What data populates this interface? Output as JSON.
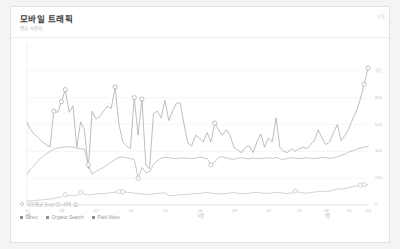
{
  "card": {
    "title": "모바일 트래픽",
    "subtitle": "평균 사용자",
    "y_axis_unit": "단위"
  },
  "options": {
    "radio_label": "이동평균 표시(7일 / 선택 값)"
  },
  "chart_data": {
    "type": "line",
    "title": "모바일 트래픽",
    "subtitle": "평균 사용자",
    "xlabel": "",
    "ylabel": "단위",
    "ylim": [
      0,
      1200
    ],
    "yticks": [
      0,
      200,
      400,
      600,
      800,
      1000
    ],
    "ytick_labels": [
      "0",
      "200",
      "400",
      "600",
      "800",
      "1천"
    ],
    "grid": true,
    "legend_position": "bottom-left",
    "x": [
      "01",
      "02",
      "03",
      "04",
      "05",
      "06",
      "07",
      "08",
      "09",
      "10",
      "11",
      "12",
      "13",
      "14",
      "15",
      "16",
      "17",
      "18",
      "19",
      "20",
      "21",
      "22",
      "23",
      "24",
      "25",
      "26",
      "27",
      "28",
      "29",
      "30",
      "31",
      "32",
      "33",
      "34",
      "35",
      "36",
      "37",
      "38",
      "39",
      "40",
      "41",
      "42",
      "43",
      "44",
      "45",
      "46",
      "47",
      "48",
      "49",
      "50",
      "51",
      "52",
      "53",
      "54",
      "55",
      "56",
      "57",
      "58",
      "59",
      "60",
      "61",
      "62",
      "63",
      "64",
      "65",
      "66",
      "67",
      "68",
      "69",
      "70",
      "71",
      "72",
      "73",
      "74",
      "75",
      "76",
      "77",
      "78",
      "79",
      "80",
      "81",
      "82",
      "83",
      "84",
      "85",
      "86",
      "87",
      "88",
      "89",
      "90"
    ],
    "xticks": [
      {
        "index": 0,
        "label": "01",
        "month": "1월"
      },
      {
        "index": 9,
        "label": "04",
        "month": ""
      },
      {
        "index": 18,
        "label": "07",
        "month": ""
      },
      {
        "index": 27,
        "label": "10",
        "month": ""
      },
      {
        "index": 36,
        "label": "13",
        "month": ""
      },
      {
        "index": 45,
        "label": "16",
        "month": "6월"
      },
      {
        "index": 54,
        "label": "19",
        "month": ""
      },
      {
        "index": 63,
        "label": "22",
        "month": ""
      },
      {
        "index": 71,
        "label": "25",
        "month": ""
      },
      {
        "index": 78,
        "label": "28",
        "month": "7월"
      },
      {
        "index": 84,
        "label": "31",
        "month": ""
      },
      {
        "index": 89,
        "label": "03",
        "month": ""
      }
    ],
    "series": [
      {
        "name": "Direct",
        "color": "#a8a8a8",
        "values": [
          615,
          560,
          525,
          500,
          470,
          448,
          432,
          700,
          690,
          770,
          860,
          690,
          740,
          430,
          620,
          560,
          270,
          700,
          640,
          660,
          700,
          735,
          720,
          880,
          600,
          470,
          440,
          420,
          800,
          520,
          790,
          300,
          270,
          680,
          700,
          650,
          780,
          630,
          700,
          760,
          760,
          600,
          460,
          440,
          520,
          500,
          470,
          540,
          470,
          610,
          560,
          520,
          560,
          520,
          430,
          410,
          390,
          430,
          440,
          390,
          470,
          530,
          430,
          500,
          470,
          650,
          430,
          400,
          390,
          420,
          400,
          420,
          430,
          420,
          450,
          480,
          560,
          500,
          450,
          470,
          540,
          600,
          480,
          520,
          570,
          640,
          700,
          790,
          900,
          1020
        ],
        "markers": [
          {
            "index": 7,
            "value": 700
          },
          {
            "index": 9,
            "value": 770
          },
          {
            "index": 10,
            "value": 860
          },
          {
            "index": 23,
            "value": 880
          },
          {
            "index": 28,
            "value": 800
          },
          {
            "index": 30,
            "value": 790
          },
          {
            "index": 49,
            "value": 610
          },
          {
            "index": 88,
            "value": 900
          },
          {
            "index": 89,
            "value": 1020
          }
        ]
      },
      {
        "name": "Organic Search",
        "color": "#b5b5b5",
        "values": [
          230,
          270,
          300,
          330,
          360,
          380,
          400,
          415,
          425,
          430,
          432,
          434,
          430,
          425,
          420,
          415,
          300,
          230,
          250,
          265,
          280,
          300,
          320,
          340,
          355,
          358,
          352,
          345,
          340,
          200,
          280,
          240,
          250,
          300,
          330,
          348,
          355,
          352,
          348,
          345,
          350,
          352,
          348,
          345,
          350,
          355,
          352,
          348,
          300,
          320,
          355,
          360,
          350,
          345,
          340,
          348,
          352,
          348,
          345,
          350,
          348,
          345,
          350,
          352,
          348,
          355,
          345,
          340,
          348,
          352,
          348,
          345,
          348,
          352,
          348,
          345,
          350,
          355,
          352,
          348,
          352,
          360,
          370,
          380,
          395,
          405,
          415,
          425,
          432,
          438
        ],
        "markers": [
          {
            "index": 16,
            "value": 300
          },
          {
            "index": 29,
            "value": 200
          },
          {
            "index": 48,
            "value": 300
          }
        ]
      },
      {
        "name": "Paid Video",
        "color": "#c4c4c4",
        "values": [
          30,
          32,
          34,
          36,
          38,
          42,
          45,
          50,
          55,
          60,
          78,
          70,
          68,
          72,
          95,
          80,
          74,
          78,
          82,
          85,
          84,
          88,
          92,
          96,
          100,
          98,
          95,
          92,
          88,
          85,
          82,
          80,
          78,
          82,
          86,
          88,
          92,
          70,
          72,
          74,
          76,
          78,
          80,
          82,
          84,
          86,
          90,
          94,
          88,
          86,
          84,
          82,
          86,
          90,
          92,
          88,
          86,
          84,
          88,
          92,
          96,
          90,
          88,
          86,
          90,
          94,
          92,
          88,
          86,
          90,
          104,
          96,
          90,
          88,
          92,
          96,
          100,
          104,
          98,
          104,
          112,
          120,
          118,
          124,
          130,
          136,
          142,
          148,
          152,
          150
        ],
        "markers": [
          {
            "index": 10,
            "value": 78
          },
          {
            "index": 14,
            "value": 95
          },
          {
            "index": 24,
            "value": 100
          },
          {
            "index": 25,
            "value": 98
          },
          {
            "index": 70,
            "value": 104
          },
          {
            "index": 87,
            "value": 148
          },
          {
            "index": 88,
            "value": 152
          }
        ]
      }
    ]
  },
  "legend": [
    {
      "label": "Direct",
      "color": "#8f8f8f"
    },
    {
      "label": "Organic Search",
      "color": "#8f8f8f"
    },
    {
      "label": "Paid Video",
      "color": "#8f8f8f"
    }
  ]
}
